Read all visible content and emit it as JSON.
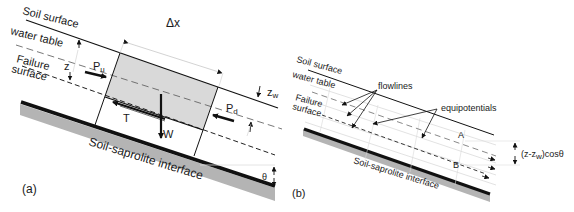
{
  "panel_a": {
    "label": "(a)",
    "soil_surface": "Soil surface",
    "water_table": "water table",
    "failure_surface_line1": "Failure",
    "failure_surface_line2": "surface",
    "interface": "Soil-saprolite interface",
    "z": "z",
    "delta_x": "Δx",
    "p_u": "P",
    "p_u_sub": "u",
    "p_d": "P",
    "p_d_sub": "d",
    "z_w": "z",
    "z_w_sub": "w",
    "t": "T",
    "w": "W",
    "theta": "θ"
  },
  "panel_b": {
    "label": "(b)",
    "soil_surface": "Soil surface",
    "water_table": "water table",
    "failure_surface_line1": "Failure",
    "failure_surface_line2": "surface",
    "interface": "Soil-saprolite interface",
    "flowlines": "flowlines",
    "equipotentials": "equipotentials",
    "point_a": "A",
    "point_b": "B",
    "dim_label_pre": "(z-z",
    "dim_label_sub": "w",
    "dim_label_post": ")cosθ"
  },
  "colors": {
    "line": "#111111",
    "block_fill": "#d9d9d9",
    "saprolite_fill": "#b4b4b4",
    "faint_line": "#cfcfcf"
  }
}
